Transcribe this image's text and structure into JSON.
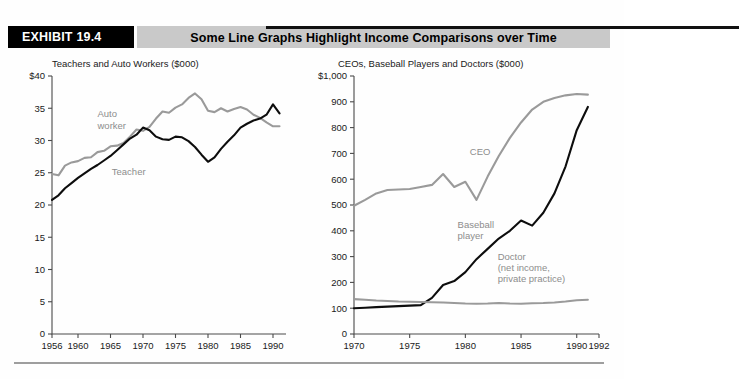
{
  "header": {
    "exhibit_label": "EXHIBIT 19.4",
    "title": "Some Line Graphs Highlight Income Comparisons over Time",
    "black_block_color": "#000000",
    "gray_block_color": "#c9c9c9"
  },
  "colors": {
    "dark_series": "#0d0d0d",
    "gray_series": "#9a9a9a",
    "axis": "#4a4a4a",
    "annotation": "#8d8d8d"
  },
  "chart_data": [
    {
      "id": "teachers-auto-workers",
      "type": "line",
      "title": "Teachers and Auto Workers ($000)",
      "xlabel": "",
      "ylabel": "",
      "xlim": [
        1956,
        1992
      ],
      "ylim": [
        0,
        40
      ],
      "yticks": [
        0,
        5,
        10,
        15,
        20,
        25,
        30,
        35,
        40
      ],
      "yticklabels": [
        "0",
        "5",
        "10",
        "15",
        "20",
        "25",
        "30",
        "35",
        "$40"
      ],
      "xticks": [
        1956,
        1960,
        1965,
        1970,
        1975,
        1980,
        1985,
        1990
      ],
      "xticklabels": [
        "1956",
        "1960",
        "1965",
        "1970",
        "1975",
        "1980",
        "1985",
        "1990"
      ],
      "grid": false,
      "legend": "inline-annotation",
      "annotations": [
        {
          "text": "Auto",
          "x": 1963.0,
          "y": 33.6,
          "color": "#8d8d8d"
        },
        {
          "text": "worker",
          "x": 1963.0,
          "y": 31.8,
          "color": "#8d8d8d"
        },
        {
          "text": "Teacher",
          "x": 1965.2,
          "y": 24.6,
          "color": "#8d8d8d"
        }
      ],
      "series": [
        {
          "name": "Auto worker",
          "color": "#9a9a9a",
          "x": [
            1956,
            1957,
            1958,
            1959,
            1960,
            1961,
            1962,
            1963,
            1964,
            1965,
            1966,
            1967,
            1968,
            1969,
            1970,
            1971,
            1972,
            1973,
            1974,
            1975,
            1976,
            1977,
            1978,
            1979,
            1980,
            1981,
            1982,
            1983,
            1984,
            1985,
            1986,
            1987,
            1988,
            1989,
            1990,
            1991
          ],
          "values": [
            24.8,
            24.6,
            26.1,
            26.6,
            26.8,
            27.3,
            27.4,
            28.2,
            28.4,
            29.1,
            29.2,
            29.6,
            30.6,
            31.7,
            31.5,
            32.1,
            33.4,
            34.5,
            34.3,
            35.1,
            35.6,
            36.6,
            37.3,
            36.4,
            34.6,
            34.4,
            35.0,
            34.5,
            34.9,
            35.2,
            34.8,
            34.0,
            33.5,
            32.8,
            32.2,
            32.2
          ]
        },
        {
          "name": "Teacher",
          "color": "#0d0d0d",
          "x": [
            1956,
            1957,
            1958,
            1959,
            1960,
            1961,
            1962,
            1963,
            1964,
            1965,
            1966,
            1967,
            1968,
            1969,
            1970,
            1971,
            1972,
            1973,
            1974,
            1975,
            1976,
            1977,
            1978,
            1979,
            1980,
            1981,
            1982,
            1983,
            1984,
            1985,
            1986,
            1987,
            1988,
            1989,
            1990,
            1991
          ],
          "values": [
            20.8,
            21.5,
            22.6,
            23.4,
            24.2,
            24.9,
            25.6,
            26.2,
            26.9,
            27.6,
            28.5,
            29.4,
            30.3,
            30.9,
            32.0,
            31.6,
            30.6,
            30.2,
            30.1,
            30.6,
            30.5,
            29.9,
            29.0,
            27.8,
            26.7,
            27.4,
            28.7,
            29.8,
            30.8,
            32.0,
            32.6,
            33.1,
            33.4,
            34.0,
            35.6,
            34.2
          ]
        }
      ]
    },
    {
      "id": "ceos-baseball-doctors",
      "type": "line",
      "title": "CEOs, Baseball Players and Doctors ($000)",
      "xlabel": "",
      "ylabel": "",
      "xlim": [
        1970,
        1992
      ],
      "ylim": [
        0,
        1000
      ],
      "yticks": [
        0,
        100,
        200,
        300,
        400,
        500,
        600,
        700,
        800,
        900,
        1000
      ],
      "yticklabels": [
        "0",
        "100",
        "200",
        "300",
        "400",
        "500",
        "600",
        "700",
        "800",
        "900",
        "$1,000"
      ],
      "xticks": [
        1970,
        1975,
        1980,
        1985,
        1990,
        1992
      ],
      "xticklabels": [
        "1970",
        "1975",
        "1980",
        "1985",
        "1990",
        "1992"
      ],
      "grid": false,
      "legend": "inline-annotation",
      "annotations": [
        {
          "text": "CEO",
          "x": 1980.4,
          "y": 695,
          "color": "#8d8d8d"
        },
        {
          "text": "Baseball",
          "x": 1979.3,
          "y": 412,
          "color": "#8d8d8d"
        },
        {
          "text": "player",
          "x": 1979.3,
          "y": 370,
          "color": "#8d8d8d"
        },
        {
          "text": "Doctor",
          "x": 1982.9,
          "y": 285,
          "color": "#8d8d8d"
        },
        {
          "text": "(net income,",
          "x": 1982.9,
          "y": 243,
          "color": "#8d8d8d"
        },
        {
          "text": "private practice)",
          "x": 1982.9,
          "y": 201,
          "color": "#8d8d8d"
        }
      ],
      "series": [
        {
          "name": "CEO",
          "color": "#9a9a9a",
          "x": [
            1970,
            1971,
            1972,
            1973,
            1974,
            1975,
            1976,
            1977,
            1978,
            1979,
            1980,
            1981,
            1982,
            1983,
            1984,
            1985,
            1986,
            1987,
            1988,
            1989,
            1990,
            1991
          ],
          "values": [
            497,
            520,
            545,
            558,
            560,
            562,
            570,
            578,
            620,
            570,
            590,
            520,
            610,
            690,
            760,
            820,
            870,
            900,
            915,
            925,
            930,
            928
          ]
        },
        {
          "name": "Baseball player",
          "color": "#0d0d0d",
          "x": [
            1970,
            1971,
            1972,
            1973,
            1974,
            1975,
            1976,
            1977,
            1978,
            1979,
            1980,
            1981,
            1982,
            1983,
            1984,
            1985,
            1986,
            1987,
            1988,
            1989,
            1990,
            1991
          ],
          "values": [
            100,
            102,
            104,
            106,
            108,
            110,
            112,
            140,
            190,
            205,
            240,
            290,
            330,
            370,
            400,
            440,
            420,
            470,
            545,
            650,
            790,
            880
          ]
        },
        {
          "name": "Doctor (net income, private practice)",
          "color": "#9a9a9a",
          "x": [
            1970,
            1971,
            1972,
            1973,
            1974,
            1975,
            1976,
            1977,
            1978,
            1979,
            1980,
            1981,
            1982,
            1983,
            1984,
            1985,
            1986,
            1987,
            1988,
            1989,
            1990,
            1991
          ],
          "values": [
            135,
            133,
            130,
            128,
            126,
            125,
            124,
            123,
            122,
            120,
            118,
            117,
            118,
            120,
            118,
            117,
            119,
            120,
            122,
            126,
            131,
            133
          ]
        }
      ]
    }
  ],
  "footer": {
    "rule_color": "#9e9e9e"
  }
}
